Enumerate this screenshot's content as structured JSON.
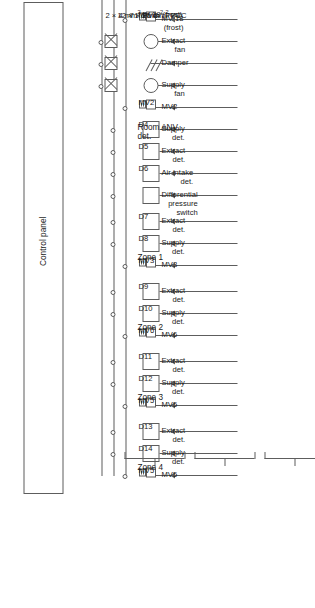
{
  "diagram": {
    "type": "schematic",
    "orientation": "rotated-90-ccw",
    "line_color": "#5d5d5d",
    "background": "#ffffff"
  },
  "control_panel": {
    "label": "Control panel"
  },
  "group_labels": {
    "room_anv": "Room ANV\ndet.",
    "zone1": "Zone 1",
    "zone2": "Zone 2",
    "zone3": "Zone 3",
    "zone4": "Zone 4"
  },
  "cables": [
    {
      "label": "7 × 15 mm² PVC",
      "conductors": 7,
      "csa": "15 mm²",
      "insulation": "PVC"
    },
    {
      "label": "12 × 1.5 mm² PVC",
      "conductors": 12,
      "csa": "1.5 mm²",
      "insulation": "PVC"
    },
    {
      "label": "2 × 4 mm² PVC",
      "conductors": 2,
      "csa": "4 mm²",
      "insulation": "PVC"
    }
  ],
  "rows": [
    {
      "id": "r1",
      "device": "mv",
      "device_tag": "MV 18\n(frost)",
      "callout": "MV 18\n(frost)",
      "group": "room_anv",
      "contactor": false
    },
    {
      "id": "r2",
      "device": "fan",
      "device_tag": "",
      "callout": "Extract\nfan",
      "group": "room_anv",
      "contactor": true
    },
    {
      "id": "r3",
      "device": "damper",
      "device_tag": "",
      "callout": "Damper",
      "group": "room_anv",
      "contactor": true
    },
    {
      "id": "r4",
      "device": "fan",
      "device_tag": "",
      "callout": "Supply\nfan",
      "group": "room_anv",
      "contactor": true
    },
    {
      "id": "r5",
      "device": "mv",
      "device_tag": "MV2",
      "callout": "MV2",
      "group": "room_anv",
      "contactor": false
    },
    {
      "id": "r6",
      "device": "det",
      "device_tag": "D4",
      "callout": "Supply\ndet.",
      "group": "room_anv",
      "contactor": false
    },
    {
      "id": "r7",
      "device": "det",
      "device_tag": "D5",
      "callout": "Extract\ndet.",
      "group": "room_anv",
      "contactor": false
    },
    {
      "id": "r8",
      "device": "det",
      "device_tag": "D6",
      "callout": "Air intake\ndet.",
      "group": "room_anv",
      "contactor": false
    },
    {
      "id": "r9",
      "device": "det",
      "device_tag": "",
      "callout": "Differential\npressure\nswitch",
      "group": "room_anv",
      "contactor": false
    },
    {
      "id": "r10",
      "device": "det",
      "device_tag": "D7",
      "callout": "Extract\ndet.",
      "group": "zone1",
      "contactor": false
    },
    {
      "id": "r11",
      "device": "det",
      "device_tag": "D8",
      "callout": "Supply\ndet.",
      "group": "zone1",
      "contactor": false
    },
    {
      "id": "r12",
      "device": "mv",
      "device_tag": "MV3",
      "callout": "MV3",
      "group": "zone1",
      "contactor": false
    },
    {
      "id": "r13",
      "device": "det",
      "device_tag": "D9",
      "callout": "Extract\ndet.",
      "group": "zone2",
      "contactor": false
    },
    {
      "id": "r14",
      "device": "det",
      "device_tag": "D10",
      "callout": "Supply\ndet.",
      "group": "zone2",
      "contactor": false
    },
    {
      "id": "r15",
      "device": "mv",
      "device_tag": "MV6",
      "callout": "MV6",
      "group": "zone2",
      "contactor": false
    },
    {
      "id": "r16",
      "device": "det",
      "device_tag": "D11",
      "callout": "Extract\ndet.",
      "group": "zone3",
      "contactor": false
    },
    {
      "id": "r17",
      "device": "det",
      "device_tag": "D12",
      "callout": "Supply\ndet.",
      "group": "zone3",
      "contactor": false
    },
    {
      "id": "r18",
      "device": "mv",
      "device_tag": "MV5",
      "callout": "MV5",
      "group": "zone3",
      "contactor": false
    },
    {
      "id": "r19",
      "device": "det",
      "device_tag": "D13",
      "callout": "Extract\ndet.",
      "group": "zone4",
      "contactor": false
    },
    {
      "id": "r20",
      "device": "det",
      "device_tag": "D14",
      "callout": "Supply\ndet.",
      "group": "zone4",
      "contactor": false
    },
    {
      "id": "r21",
      "device": "mv",
      "device_tag": "MV5",
      "callout": "MV5",
      "group": "zone4",
      "contactor": false
    }
  ],
  "detector_tags": [
    "D4",
    "D5",
    "D6",
    "D7",
    "D8",
    "D9",
    "D10",
    "D11",
    "D12",
    "D13",
    "D14"
  ],
  "valve_tags": [
    "MV 18 (frost)",
    "MV2",
    "MV3",
    "MV5",
    "MV6"
  ]
}
